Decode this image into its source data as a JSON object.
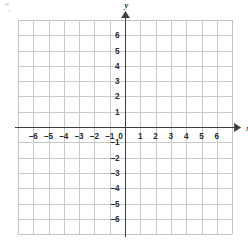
{
  "figure": {
    "kind": "cartesian-coordinate-grid",
    "background_color": "#ffffff",
    "grid_color": "#c9c9c9",
    "axis_color": "#3c3c3c",
    "label_color": "#2b2b2b"
  },
  "axes": {
    "x_axis_name": "x",
    "y_axis_name": "y",
    "origin_label": "0"
  },
  "chart_data": {
    "type": "scatter",
    "title": "",
    "subtitle": "",
    "xlabel": "x",
    "ylabel": "y",
    "xlim": [
      -7,
      7
    ],
    "ylim": [
      -7,
      7
    ],
    "xticks": [
      -6,
      -5,
      -4,
      -3,
      -2,
      -1,
      0,
      1,
      2,
      3,
      4,
      5,
      6
    ],
    "yticks": [
      6,
      5,
      4,
      3,
      2,
      1,
      -1,
      -2,
      -3,
      -4,
      -5,
      -6
    ],
    "xtick_labels": [
      "–6",
      "–5",
      "–4",
      "–3",
      "–2",
      "–1",
      "0",
      "1",
      "2",
      "3",
      "4",
      "5",
      "6"
    ],
    "ytick_labels": [
      "6",
      "5",
      "4",
      "3",
      "2",
      "1",
      "–1",
      "–2",
      "–3",
      "–4",
      "–5",
      "–6"
    ],
    "grid": true,
    "grid_step": 1,
    "legend": null,
    "series": [],
    "annotations": [],
    "x_arrow": "right",
    "y_arrow": "up"
  }
}
